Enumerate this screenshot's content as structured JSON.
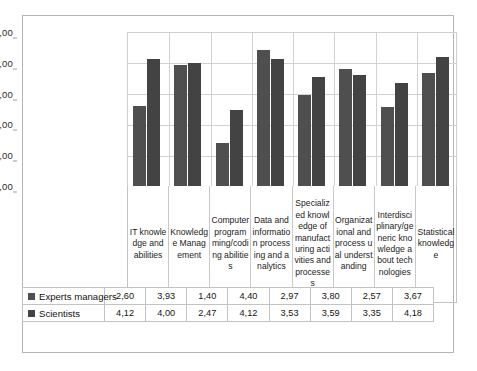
{
  "chart_data": {
    "type": "bar",
    "title": "",
    "xlabel": "",
    "ylabel": "",
    "ylim": [
      0,
      5
    ],
    "ytick_labels": [
      "0,00",
      "1,00",
      "2,00",
      "3,00",
      "4,00",
      "5,00"
    ],
    "ytick_values": [
      0,
      1,
      2,
      3,
      4,
      5
    ],
    "grid": true,
    "legend_position": "table-left",
    "categories": [
      "IT knowledge and abilities",
      "Knowledge Management",
      "Computer programming/coding abilities",
      "Data and information processing and analytics",
      "Specialized knowledge of manufacturing activities and processes",
      "Organizational and process ual understanding",
      "Interdisciplinary/generic knowledge about technologies",
      "Statistical knowledge"
    ],
    "series": [
      {
        "name": "Experts managers",
        "color": "#4f4f4f",
        "values": [
          2.6,
          3.93,
          1.4,
          4.4,
          2.97,
          3.8,
          2.57,
          3.67
        ],
        "labels": [
          "2,60",
          "3,93",
          "1,40",
          "4,40",
          "2,97",
          "3,80",
          "2,57",
          "3,67"
        ]
      },
      {
        "name": "Scientists",
        "color": "#434343",
        "values": [
          4.12,
          4.0,
          2.47,
          4.12,
          3.53,
          3.59,
          3.35,
          4.18
        ],
        "labels": [
          "4,12",
          "4,00",
          "2,47",
          "4,12",
          "3,53",
          "3,59",
          "3,35",
          "4,18"
        ]
      }
    ]
  }
}
